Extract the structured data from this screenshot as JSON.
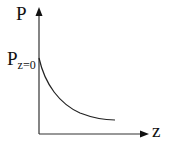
{
  "diagram": {
    "y_axis_label": "P",
    "x_axis_label": "z",
    "intercept_label_main": "P",
    "intercept_label_sub": "z=0",
    "curve": "exponential decay from P at z=0",
    "colors": {
      "line": "#222222",
      "background": "#ffffff"
    }
  }
}
